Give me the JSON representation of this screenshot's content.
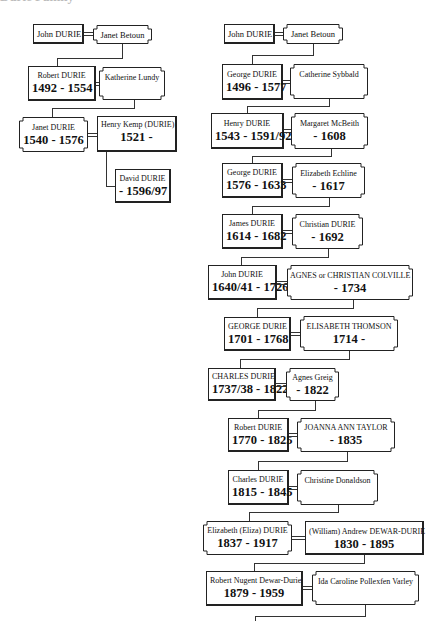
{
  "header": {
    "text": "Durie Family"
  },
  "left_tree": {
    "gen1": {
      "husband": {
        "name": "John DURIE",
        "dates": ""
      },
      "wife": {
        "name": "Janet Betoun",
        "dates": ""
      }
    },
    "gen2": {
      "husband": {
        "name": "Robert DURIE",
        "dates": "1492 - 1554"
      },
      "wife": {
        "name": "Katherine Lundy",
        "dates": ""
      }
    },
    "gen3": {
      "wife": {
        "name": "Janet DURIE",
        "dates": "1540 - 1576"
      },
      "husband": {
        "name": "Henry Kemp (DURIE)",
        "dates": "1521 -"
      }
    },
    "gen4": {
      "child": {
        "name": "David DURIE",
        "dates": "- 1596/97"
      }
    }
  },
  "right_tree": {
    "generations": [
      {
        "left": {
          "name": "John DURIE",
          "dates": ""
        },
        "right": {
          "name": "Janet Betoun",
          "dates": ""
        }
      },
      {
        "left": {
          "name": "George DURIE",
          "dates": "1496 - 1577"
        },
        "right": {
          "name": "Catherine Sybbald",
          "dates": ""
        }
      },
      {
        "left": {
          "name": "Henry DURIE",
          "dates": "1543 - 1591/92"
        },
        "right": {
          "name": "Margaret McBeith",
          "dates": "- 1608"
        }
      },
      {
        "left": {
          "name": "George DURIE",
          "dates": "1576 - 1633"
        },
        "right": {
          "name": "Elizabeth Echline",
          "dates": "- 1617"
        }
      },
      {
        "left": {
          "name": "James DURIE",
          "dates": "1614 - 1682"
        },
        "right": {
          "name": "Christian DURIE",
          "dates": "- 1692"
        }
      },
      {
        "left": {
          "name": "John DURIE",
          "dates": "1640/41 - 1726"
        },
        "right": {
          "name": "AGNES or CHRISTIAN COLVILLE",
          "dates": "- 1734"
        }
      },
      {
        "left": {
          "name": "GEORGE DURIE",
          "dates": "1701 - 1768"
        },
        "right": {
          "name": "ELISABETH THOMSON",
          "dates": "1714 -"
        }
      },
      {
        "left": {
          "name": "CHARLES DURIE",
          "dates": "1737/38 - 1822"
        },
        "right": {
          "name": "Agnes Greig",
          "dates": "- 1822"
        }
      },
      {
        "left": {
          "name": "Robert DURIE",
          "dates": "1770 - 1825"
        },
        "right": {
          "name": "JOANNA ANN TAYLOR",
          "dates": "- 1835"
        }
      },
      {
        "left": {
          "name": "Charles DURIE",
          "dates": "1815 - 1845"
        },
        "right": {
          "name": "Christine Donaldson",
          "dates": ""
        }
      },
      {
        "left": {
          "name": "Elizabeth (Eliza) DURIE",
          "dates": "1837 - 1917"
        },
        "right": {
          "name": "(William) Andrew DEWAR-DURIE",
          "dates": "1830 - 1895"
        }
      },
      {
        "left": {
          "name": "Robert Nugent Dewar-Durie",
          "dates": "1879 - 1959"
        },
        "right": {
          "name": "Ida Caroline Pollexfen Varley",
          "dates": ""
        }
      }
    ]
  },
  "colors": {
    "line": "#333333",
    "background": "#ffffff",
    "text": "#111111"
  }
}
